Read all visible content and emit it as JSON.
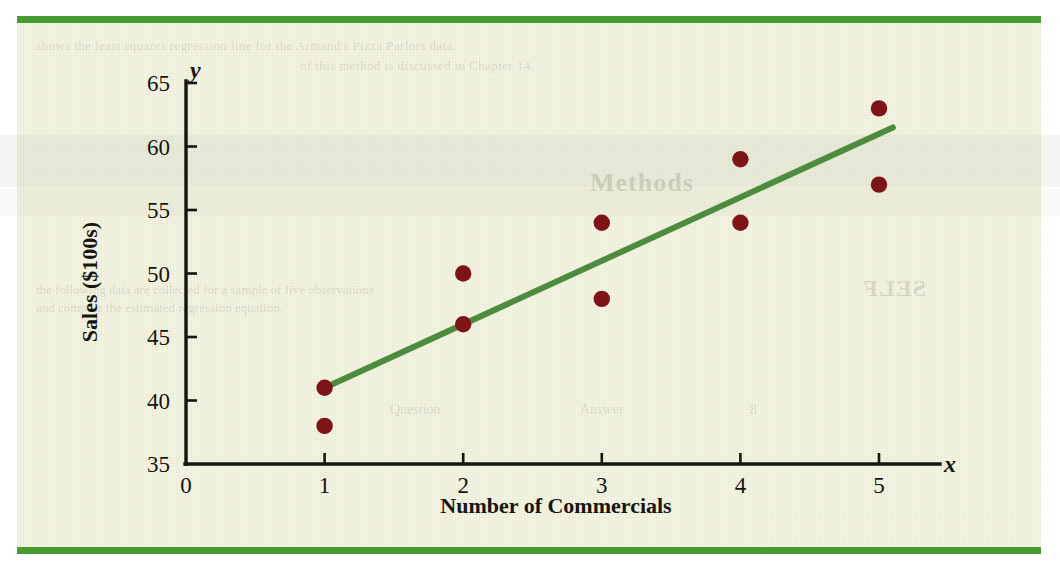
{
  "page": {
    "background_color": "#f3f3e2",
    "rule_color": "#479b33"
  },
  "ghost_text": {
    "line1": "shows the least squares regression line for the Armand's Pizza Parlors data.",
    "line2": "of this method is discussed in Chapter 14.",
    "heading": "Methods",
    "self_test": "SELF",
    "line3": "the following data are collected for a sample of five observations",
    "line4": "and compute the estimated regression equation.",
    "q": "Question",
    "a": "Answer",
    "n": "8"
  },
  "chart_data": {
    "type": "scatter",
    "title": "",
    "xlabel": "Number of Commercials",
    "ylabel": "Sales ($100s)",
    "x_axis_variable": "x",
    "y_axis_variable": "y",
    "xlim": [
      0,
      5.6
    ],
    "ylim": [
      35,
      65
    ],
    "xticks": [
      0,
      1,
      2,
      3,
      4,
      5
    ],
    "yticks": [
      35,
      40,
      45,
      50,
      55,
      60,
      65
    ],
    "xtick_labels": [
      "0",
      "1",
      "2",
      "3",
      "4",
      "5"
    ],
    "ytick_labels": [
      "35",
      "40",
      "45",
      "50",
      "55",
      "60",
      "65"
    ],
    "grid": false,
    "legend": false,
    "point_color": "#7d1417",
    "line_color": "#4d8c3f",
    "points": [
      {
        "x": 1,
        "y": 41
      },
      {
        "x": 1,
        "y": 38
      },
      {
        "x": 2,
        "y": 50
      },
      {
        "x": 2,
        "y": 46
      },
      {
        "x": 3,
        "y": 54
      },
      {
        "x": 3,
        "y": 48
      },
      {
        "x": 4,
        "y": 59
      },
      {
        "x": 4,
        "y": 54
      },
      {
        "x": 5,
        "y": 63
      },
      {
        "x": 5,
        "y": 57
      }
    ],
    "series": [
      {
        "name": "Estimated regression line",
        "type": "line",
        "slope": 5,
        "intercept": 36,
        "x": [
          1,
          5.1
        ],
        "values": [
          41,
          61.5
        ]
      }
    ]
  }
}
